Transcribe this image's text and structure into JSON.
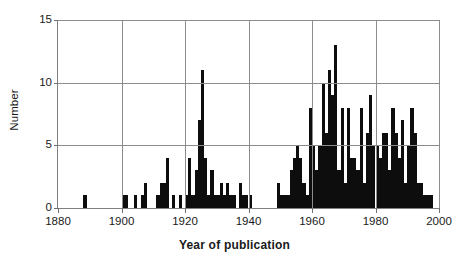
{
  "chart_data": {
    "type": "bar",
    "title": "",
    "xlabel": "Year of publication",
    "ylabel": "Number",
    "xlim": [
      1880,
      2000
    ],
    "ylim": [
      0,
      15
    ],
    "grid": true,
    "legend": false,
    "xticks": [
      1880,
      1900,
      1920,
      1940,
      1960,
      1980,
      2000
    ],
    "yticks": [
      0,
      5,
      10,
      15
    ],
    "bar_color": "#0d0d0d",
    "axis_color": "#808080",
    "grid_color": "#8c8c8c",
    "x": [
      1888,
      1900,
      1901,
      1904,
      1906,
      1907,
      1911,
      1912,
      1913,
      1914,
      1916,
      1918,
      1920,
      1921,
      1922,
      1923,
      1924,
      1925,
      1926,
      1927,
      1928,
      1929,
      1930,
      1931,
      1932,
      1933,
      1934,
      1935,
      1937,
      1938,
      1939,
      1940,
      1949,
      1950,
      1951,
      1952,
      1953,
      1954,
      1955,
      1956,
      1957,
      1958,
      1959,
      1960,
      1961,
      1962,
      1963,
      1964,
      1965,
      1966,
      1967,
      1968,
      1969,
      1970,
      1971,
      1972,
      1973,
      1974,
      1975,
      1976,
      1977,
      1978,
      1979,
      1980,
      1981,
      1982,
      1983,
      1984,
      1985,
      1986,
      1987,
      1988,
      1989,
      1990,
      1991,
      1992,
      1993,
      1994,
      1995,
      1996,
      1997
    ],
    "values": [
      1,
      1,
      1,
      1,
      1,
      2,
      1,
      2,
      2,
      4,
      1,
      1,
      1,
      4,
      1,
      3,
      7,
      11,
      4,
      1,
      3,
      1,
      1,
      2,
      1,
      2,
      1,
      1,
      2,
      1,
      1,
      1,
      2,
      1,
      1,
      1,
      3,
      4,
      5,
      4,
      2,
      1,
      8,
      5,
      3,
      5,
      10,
      6,
      11,
      9,
      13,
      3,
      8,
      2,
      8,
      4,
      4,
      3,
      8,
      2,
      6,
      9,
      5,
      5,
      4,
      6,
      6,
      3,
      8,
      6,
      4,
      7,
      2,
      5,
      8,
      6,
      2,
      2,
      1,
      1,
      1
    ],
    "series_name": "Publications per year"
  }
}
